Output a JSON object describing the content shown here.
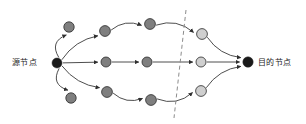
{
  "diagram": {
    "type": "directed-graph",
    "labels": {
      "source": "源节点",
      "destination": "目的节点"
    },
    "colors": {
      "terminal_node": "#1a1a1a",
      "dark_node": "#7f7f7f",
      "light_node": "#cfcfcf",
      "node_stroke": "#2b2b2b",
      "edge": "#3a3a3a",
      "divider": "#8c8c8c",
      "background": "#ffffff",
      "text": "#1c1c1c"
    },
    "nodes": [
      {
        "id": "source",
        "name": "source-node",
        "x": 57,
        "y": 63,
        "r": 5.0,
        "fill": "terminal_node"
      },
      {
        "id": "t0",
        "name": "top-stub-node",
        "x": 69,
        "y": 27,
        "r": 5.2,
        "fill": "dark_node"
      },
      {
        "id": "b0",
        "name": "bottom-stub-node",
        "x": 71,
        "y": 98,
        "r": 5.2,
        "fill": "dark_node"
      },
      {
        "id": "t1",
        "name": "top-node-1",
        "x": 105,
        "y": 31,
        "r": 5.4,
        "fill": "dark_node"
      },
      {
        "id": "t2",
        "name": "top-node-2",
        "x": 150,
        "y": 24,
        "r": 5.4,
        "fill": "dark_node"
      },
      {
        "id": "t3",
        "name": "top-node-3",
        "x": 202,
        "y": 34,
        "r": 5.4,
        "fill": "light_node"
      },
      {
        "id": "m1",
        "name": "middle-node-1",
        "x": 106,
        "y": 62,
        "r": 5.0,
        "fill": "dark_node"
      },
      {
        "id": "m2",
        "name": "middle-node-2",
        "x": 147,
        "y": 62,
        "r": 5.0,
        "fill": "dark_node"
      },
      {
        "id": "m3",
        "name": "middle-node-3",
        "x": 201,
        "y": 62,
        "r": 5.0,
        "fill": "light_node"
      },
      {
        "id": "b1",
        "name": "bottom-node-1",
        "x": 107,
        "y": 92,
        "r": 5.4,
        "fill": "dark_node"
      },
      {
        "id": "b2",
        "name": "bottom-node-2",
        "x": 151,
        "y": 100,
        "r": 5.4,
        "fill": "dark_node"
      },
      {
        "id": "b3",
        "name": "bottom-node-3",
        "x": 201,
        "y": 91,
        "r": 5.4,
        "fill": "light_node"
      },
      {
        "id": "dest",
        "name": "destination-node",
        "x": 248,
        "y": 62,
        "r": 5.2,
        "fill": "terminal_node"
      }
    ],
    "edges": [
      {
        "name": "edge-source-to-top-stub",
        "from": "source",
        "to": "t0",
        "curve": "arc-left-up"
      },
      {
        "name": "edge-source-to-bottom-stub",
        "from": "source",
        "to": "b0",
        "curve": "arc-left-down"
      },
      {
        "name": "edge-source-to-top1",
        "from": "source",
        "to": "t1",
        "curve": "arc-up"
      },
      {
        "name": "edge-top1-to-top2",
        "from": "t1",
        "to": "t2",
        "curve": "arc-up"
      },
      {
        "name": "edge-top2-to-top3",
        "from": "t2",
        "to": "t3",
        "curve": "arc-over"
      },
      {
        "name": "edge-top3-to-dest",
        "from": "t3",
        "to": "dest",
        "curve": "arc-down"
      },
      {
        "name": "edge-source-to-mid1",
        "from": "source",
        "to": "m1",
        "curve": "straight"
      },
      {
        "name": "edge-mid1-to-mid2",
        "from": "m1",
        "to": "m2",
        "curve": "straight"
      },
      {
        "name": "edge-mid2-to-mid3",
        "from": "m2",
        "to": "m3",
        "curve": "straight"
      },
      {
        "name": "edge-mid3-to-dest",
        "from": "m3",
        "to": "dest",
        "curve": "straight"
      },
      {
        "name": "edge-source-to-bot1",
        "from": "source",
        "to": "b1",
        "curve": "arc-down"
      },
      {
        "name": "edge-bot1-to-bot2",
        "from": "b1",
        "to": "b2",
        "curve": "arc-down"
      },
      {
        "name": "edge-bot2-to-bot3",
        "from": "b2",
        "to": "b3",
        "curve": "arc-under"
      },
      {
        "name": "edge-bot3-to-dest",
        "from": "b3",
        "to": "dest",
        "curve": "arc-up"
      }
    ],
    "divider": {
      "name": "dashed-divider-line",
      "style": "dashed",
      "x1": 186,
      "y1": 10,
      "x2": 174,
      "y2": 118
    }
  }
}
